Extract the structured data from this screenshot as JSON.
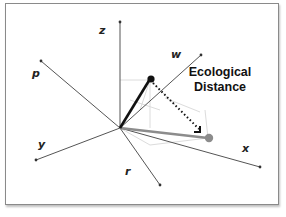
{
  "diagram": {
    "axes": [
      {
        "name": "z",
        "label": "z"
      },
      {
        "name": "w",
        "label": "w"
      },
      {
        "name": "p",
        "label": "p"
      },
      {
        "name": "y",
        "label": "y"
      },
      {
        "name": "r",
        "label": "r"
      },
      {
        "name": "x",
        "label": "x"
      }
    ],
    "annotation": {
      "line1": "Ecological",
      "line2": "Distance"
    },
    "points": [
      {
        "name": "black-point",
        "color": "#111111"
      },
      {
        "name": "gray-point",
        "color": "#8c8c8c"
      }
    ],
    "colors": {
      "axis": "#555555",
      "black_vector": "#111111",
      "gray_vector": "#8c8c8c",
      "projection": "#d8d8d8",
      "distance": "#111111"
    }
  }
}
